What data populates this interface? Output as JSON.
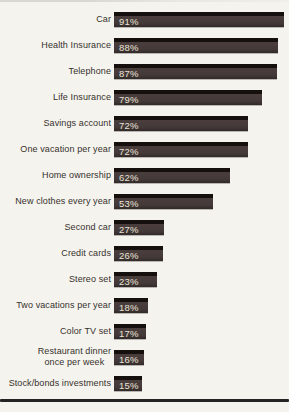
{
  "page": {
    "background_color": "#f5f3ee"
  },
  "chart_data": {
    "type": "bar",
    "orientation": "horizontal",
    "title": "",
    "xlabel": "",
    "ylabel": "",
    "xlim": [
      0,
      100
    ],
    "grid": false,
    "legend": false,
    "categories": [
      "Car",
      "Health Insurance",
      "Telephone",
      "Life Insurance",
      "Savings account",
      "One vacation per year",
      "Home ownership",
      "New clothes every year",
      "Second car",
      "Credit cards",
      "Stereo set",
      "Two vacations per year",
      "Color TV set",
      "Restaurant dinner\nonce per week",
      "Stock/bonds investments"
    ],
    "values": [
      91,
      88,
      87,
      79,
      72,
      72,
      62,
      53,
      27,
      26,
      23,
      18,
      17,
      16,
      15
    ],
    "value_labels": [
      "91%",
      "88%",
      "87%",
      "79%",
      "72%",
      "72%",
      "62%",
      "53%",
      "27%",
      "26%",
      "23%",
      "18%",
      "17%",
      "16%",
      "15%"
    ],
    "bar_color": "#443939",
    "bar_top_edge_color": "#15100d",
    "value_label_color": "#eae4d6",
    "category_label_color": "#35312d",
    "bottom_rule_color": "#232323"
  }
}
